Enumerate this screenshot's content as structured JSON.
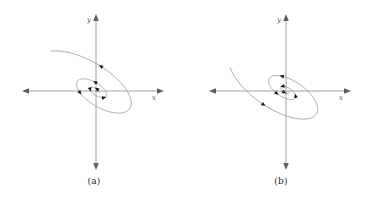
{
  "figure": {
    "title": "",
    "background_color": "#ffffff",
    "curve_color": "#8a8a8a",
    "axis_color": "#8a8a8a",
    "arrow_color": "#141414",
    "label_color": "#555555"
  },
  "panels": [
    {
      "id": "a",
      "caption": "(a)",
      "axis_x_label": "x",
      "axis_y_label": "y",
      "description": "unstable spiral",
      "spiral_direction": "outward",
      "rotation_sense": "clockwise",
      "tilt_degrees": -32,
      "turns": 2.4,
      "arrow_count": 6
    },
    {
      "id": "b",
      "caption": "(b)",
      "axis_x_label": "x",
      "axis_y_label": "y",
      "description": "stable spiral",
      "spiral_direction": "inward",
      "rotation_sense": "counterclockwise",
      "tilt_degrees": -32,
      "turns": 2.4,
      "arrow_count": 6
    }
  ],
  "chart_data": {
    "type": "line",
    "title": "",
    "xlabel": "x",
    "ylabel": "y",
    "grid": false,
    "legend": "none",
    "xlim": [
      -1.15,
      1.15
    ],
    "ylim": [
      -1.15,
      1.15
    ],
    "series": [
      {
        "name": "(a) unstable spiral trajectory",
        "panel": "a",
        "kind": "logarithmic-spiral",
        "growth_per_turn": 1.95,
        "ellipse_aspect": 0.46,
        "tilt_degrees": -32,
        "theta_start_degrees": 0,
        "theta_end_degrees": 880,
        "r_start": 0.055,
        "r_end": 1.02,
        "sense": "clockwise",
        "arrow_theta_degrees": [
          95,
          215,
          345,
          470,
          600,
          820
        ]
      },
      {
        "name": "(b) stable spiral trajectory",
        "panel": "b",
        "kind": "logarithmic-spiral",
        "growth_per_turn": 1.95,
        "ellipse_aspect": 0.46,
        "tilt_degrees": -32,
        "theta_start_degrees": 0,
        "theta_end_degrees": 880,
        "r_start": 0.055,
        "r_end": 1.02,
        "sense": "counterclockwise",
        "arrow_theta_degrees": [
          95,
          215,
          345,
          470,
          600,
          820
        ]
      }
    ],
    "axes": [
      {
        "panel": "a",
        "x_axis": [
          -1.15,
          1.15
        ],
        "y_axis": [
          -1.15,
          1.15
        ]
      },
      {
        "panel": "b",
        "x_axis": [
          -1.15,
          1.15
        ],
        "y_axis": [
          -1.15,
          1.15
        ]
      }
    ]
  }
}
